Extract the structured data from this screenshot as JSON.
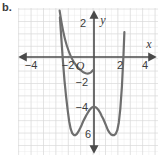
{
  "figure": {
    "part_label": "b.",
    "background_color": "#ffffff",
    "grid_minor_color": "#e6e6e6",
    "grid_major_color": "#d5d5d5",
    "axis_color": "#4a4a4a",
    "curve_color": "#6e6e6e",
    "label_color": "#3b3b3b"
  },
  "chart_data": {
    "type": "line",
    "title": "",
    "subtitle": "",
    "xlabel": "x",
    "ylabel": "y",
    "origin_label": "O",
    "xlim": [
      -5,
      5.2
    ],
    "ylim": [
      -7.3,
      3.3
    ],
    "grid": true,
    "grid_minor_step": 0.5,
    "grid_major_step": 1,
    "legend_position": "none",
    "xticks": [
      -4,
      -2,
      2,
      4
    ],
    "xtick_labels": [
      "−4",
      "−2",
      "2",
      "4"
    ],
    "yticks": [
      2,
      -2,
      -4,
      -6
    ],
    "ytick_labels": [
      "2",
      "−2",
      "−4",
      "6"
    ],
    "annotations": [
      {
        "name": "x-axis-name",
        "text": "x"
      },
      {
        "name": "y-axis-name",
        "text": "y"
      },
      {
        "name": "origin",
        "text": "O"
      }
    ],
    "series": [
      {
        "name": "quartic",
        "description": "W-shaped quartic curve",
        "local_maximum": [
          0,
          -4
        ],
        "minima": [
          [
            -2.1,
            -6.3
          ],
          [
            1.7,
            -6.3
          ]
        ],
        "x": [
          -2.75,
          -2.62,
          -2.5,
          -2.38,
          -2.25,
          -2.12,
          -2.0,
          -1.88,
          -1.75,
          -1.62,
          -1.5,
          -1.38,
          -1.25,
          -1.12,
          -1.0,
          -0.88,
          -0.75,
          -0.62,
          -0.5,
          -0.38,
          -0.25,
          -0.12,
          0.0,
          0.12,
          0.25,
          0.38,
          0.5,
          0.62,
          0.75,
          0.88,
          1.0,
          1.12,
          1.25,
          1.38,
          1.5,
          1.62,
          1.75,
          1.88,
          2.0,
          2.12,
          2.25,
          2.38,
          2.45
        ],
        "y": [
          3.2,
          1.3,
          -0.4,
          -1.9,
          -3.2,
          -4.3,
          -5.2,
          -5.8,
          -6.15,
          -6.3,
          -6.3,
          -6.2,
          -6.0,
          -5.75,
          -5.5,
          -5.2,
          -4.95,
          -4.7,
          -4.5,
          -4.3,
          -4.15,
          -4.05,
          -4.0,
          -4.05,
          -4.15,
          -4.3,
          -4.5,
          -4.75,
          -5.0,
          -5.3,
          -5.6,
          -5.9,
          -6.1,
          -6.25,
          -6.3,
          -6.3,
          -6.2,
          -5.9,
          -5.3,
          -4.2,
          -2.4,
          0.2,
          2.0
        ]
      }
    ]
  }
}
